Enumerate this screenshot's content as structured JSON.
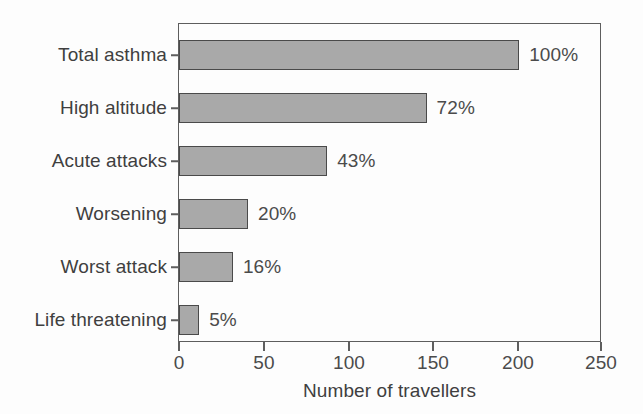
{
  "chart_data": {
    "type": "bar",
    "orientation": "horizontal",
    "title": "",
    "xlabel": "Number of travellers",
    "ylabel": "",
    "xlim": [
      0,
      250
    ],
    "xticks": [
      0,
      50,
      100,
      150,
      200,
      250
    ],
    "xticklabels": [
      "0",
      "50",
      "100",
      "150",
      "200",
      "250"
    ],
    "grid": false,
    "legend": null,
    "categories": [
      "Total asthma",
      "High altitude",
      "Acute attacks",
      "Worsening",
      "Worst attack",
      "Life threatening"
    ],
    "values": [
      202,
      147,
      88,
      41,
      32,
      12
    ],
    "data_labels": [
      "100%",
      "72%",
      "43%",
      "20%",
      "16%",
      "5%"
    ],
    "series": [
      {
        "name": "Number of travellers",
        "values": [
          202,
          147,
          88,
          41,
          32,
          12
        ]
      }
    ],
    "bar_fill_color": "#a9a9a9",
    "bar_edge_color": "#4a4a4a",
    "axis_color": "#5e5e5e",
    "text_color": "#3f3f3f"
  }
}
